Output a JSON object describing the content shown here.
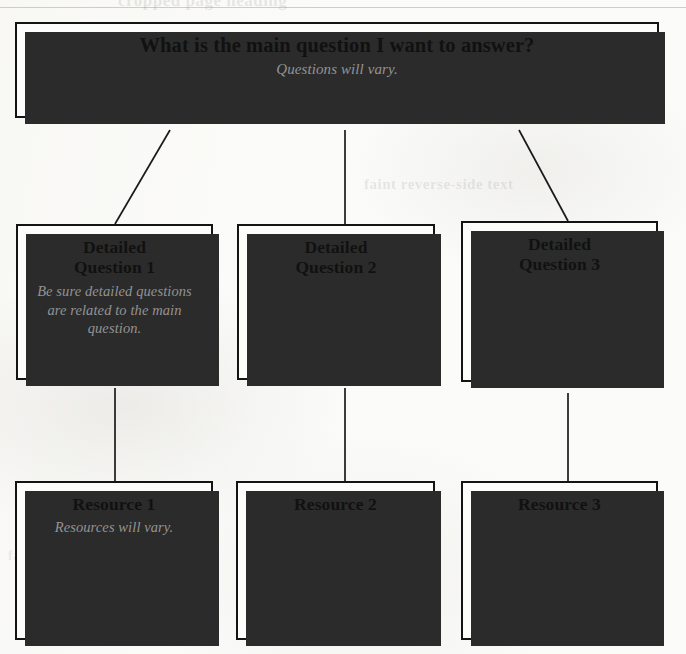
{
  "page": {
    "title": "What is the main question I want to answer?",
    "background_color": "#fbfbf9",
    "box_fill_color": "#fdfdfb",
    "box_border_color": "#141414",
    "shadow_color": "#2b2b2b",
    "note_text_color": "#939393",
    "title_text_color": "#111111"
  },
  "bleed_through": {
    "top": "cropped page heading",
    "middle": "faint reverse-side text",
    "left": "faint reverse-side text"
  },
  "root": {
    "label": "What is the main question I want to answer?",
    "note": "Questions will vary."
  },
  "questions": [
    {
      "label": "Detailed\nQuestion 1",
      "note": "Be sure detailed questions are related to the main question."
    },
    {
      "label": "Detailed\nQuestion 2",
      "note": ""
    },
    {
      "label": "Detailed\nQuestion 3",
      "note": ""
    }
  ],
  "resources": [
    {
      "label": "Resource 1",
      "note": "Resources will vary."
    },
    {
      "label": "Resource 2",
      "note": ""
    },
    {
      "label": "Resource 3",
      "note": ""
    }
  ],
  "connectors": {
    "root_to_questions": [
      {
        "from_x": 170,
        "from_y": 130,
        "to_x": 115,
        "to_y": 224
      },
      {
        "from_x": 345,
        "from_y": 130,
        "to_x": 345,
        "to_y": 224
      },
      {
        "from_x": 519,
        "from_y": 130,
        "to_x": 568,
        "to_y": 221
      }
    ],
    "questions_to_resources": [
      {
        "from_x": 115,
        "from_y": 388,
        "to_x": 115,
        "to_y": 481
      },
      {
        "from_x": 345,
        "from_y": 388,
        "to_x": 345,
        "to_y": 481
      },
      {
        "from_x": 568,
        "from_y": 393,
        "to_x": 568,
        "to_y": 481
      }
    ]
  }
}
